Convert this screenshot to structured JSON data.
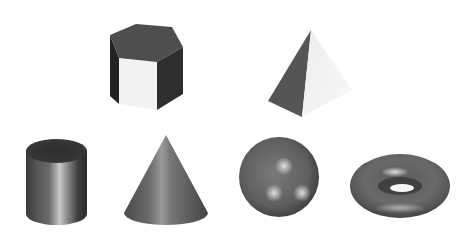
{
  "scene": {
    "width": 469,
    "height": 240,
    "background": "#ffffff",
    "shapes": [
      {
        "name": "hexagonal-prism",
        "row": 1,
        "position": "top-left"
      },
      {
        "name": "pyramid",
        "row": 1,
        "position": "top-right"
      },
      {
        "name": "cylinder",
        "row": 2,
        "position": "bottom-1"
      },
      {
        "name": "cone",
        "row": 2,
        "position": "bottom-2"
      },
      {
        "name": "sphere",
        "row": 2,
        "position": "bottom-3"
      },
      {
        "name": "torus",
        "row": 2,
        "position": "bottom-4"
      }
    ],
    "colors": {
      "dark_face": "#2a2a2a",
      "top_face": "#4e4e4e",
      "light_face": "#f2f2f2",
      "metal_mid": "#6a6a6a",
      "highlight": "#d8d8d8"
    }
  }
}
